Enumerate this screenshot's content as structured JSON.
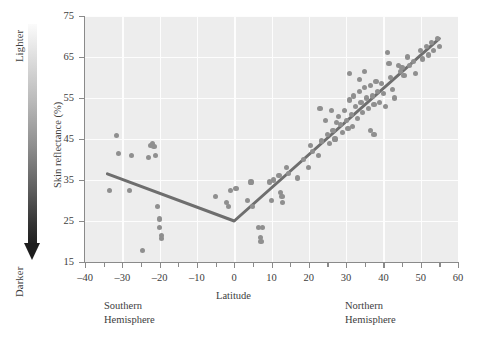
{
  "chart_data": {
    "type": "scatter",
    "title": "",
    "xlabel": "Latitude",
    "ylabel": "Skin reflectance (%)",
    "xlim": [
      -40,
      60
    ],
    "ylim": [
      15,
      75
    ],
    "xticks": [
      -40,
      -30,
      -20,
      -10,
      0,
      10,
      20,
      30,
      40,
      50,
      60
    ],
    "xtick_labels": [
      "–40",
      "–30",
      "–20",
      "–10",
      "0",
      "10",
      "20",
      "30",
      "40",
      "50",
      "60"
    ],
    "xtick_minor_step": 5,
    "yticks": [
      15,
      25,
      35,
      45,
      55,
      65,
      75
    ],
    "ytick_labels": [
      "15",
      "25",
      "35",
      "45",
      "55",
      "65",
      "75"
    ],
    "grid": true,
    "grid_color": "#fdfdfd",
    "plot_background": "#ededed",
    "legend": "none",
    "point_color": "#8f8f8f",
    "trendline_color": "#6e6e6e",
    "trendline": {
      "type": "piecewise-linear",
      "vertex": [
        0,
        25
      ],
      "points": [
        [
          -34,
          36.5
        ],
        [
          0,
          25
        ],
        [
          55,
          69.5
        ]
      ]
    },
    "annotations": [
      {
        "text": "Lighter",
        "position": "left-axis-top"
      },
      {
        "text": "Darker",
        "position": "left-axis-bottom"
      },
      {
        "text": "Southern\nHemisphere",
        "position": "below-axis-left"
      },
      {
        "text": "Northern\nHemisphere",
        "position": "below-axis-right"
      }
    ],
    "points": [
      [
        -33.5,
        32.5
      ],
      [
        -31.5,
        45.8
      ],
      [
        -31.0,
        41.5
      ],
      [
        -28.0,
        32.5
      ],
      [
        -27.5,
        41.0
      ],
      [
        -24.5,
        17.8
      ],
      [
        -23.0,
        40.5
      ],
      [
        -22.5,
        43.5
      ],
      [
        -22.0,
        44.0
      ],
      [
        -21.5,
        43.2
      ],
      [
        -21.0,
        41.0
      ],
      [
        -20.5,
        28.5
      ],
      [
        -20.0,
        25.5
      ],
      [
        -20.0,
        23.5
      ],
      [
        -19.5,
        21.5
      ],
      [
        -19.5,
        20.8
      ],
      [
        -5.0,
        31.0
      ],
      [
        -2.0,
        29.5
      ],
      [
        -1.5,
        28.5
      ],
      [
        -1.0,
        32.5
      ],
      [
        0.5,
        33.0
      ],
      [
        3.5,
        30.0
      ],
      [
        4.5,
        34.5
      ],
      [
        5.0,
        28.5
      ],
      [
        6.5,
        23.5
      ],
      [
        7.5,
        23.5
      ],
      [
        7.0,
        21.0
      ],
      [
        7.2,
        20.0
      ],
      [
        9.5,
        34.5
      ],
      [
        10.0,
        30.0
      ],
      [
        10.5,
        35.0
      ],
      [
        12.0,
        36.0
      ],
      [
        12.5,
        32.0
      ],
      [
        12.8,
        31.0
      ],
      [
        13.0,
        29.5
      ],
      [
        14.0,
        38.0
      ],
      [
        14.5,
        36.5
      ],
      [
        17.0,
        35.5
      ],
      [
        20.5,
        43.5
      ],
      [
        21.0,
        42.0
      ],
      [
        22.5,
        41.0
      ],
      [
        23.5,
        44.5
      ],
      [
        25.0,
        46.0
      ],
      [
        25.5,
        44.0
      ],
      [
        26.5,
        47.0
      ],
      [
        27.0,
        45.0
      ],
      [
        27.5,
        49.0
      ],
      [
        28.0,
        50.5
      ],
      [
        28.5,
        48.5
      ],
      [
        29.0,
        46.5
      ],
      [
        29.5,
        52.0
      ],
      [
        30.0,
        49.5
      ],
      [
        30.5,
        47.5
      ],
      [
        31.0,
        54.5
      ],
      [
        31.5,
        51.0
      ],
      [
        31.8,
        48.0
      ],
      [
        32.0,
        55.5
      ],
      [
        32.5,
        53.0
      ],
      [
        33.0,
        50.0
      ],
      [
        33.5,
        56.5
      ],
      [
        34.0,
        54.0
      ],
      [
        34.5,
        51.5
      ],
      [
        35.0,
        57.5
      ],
      [
        35.5,
        55.0
      ],
      [
        36.0,
        52.5
      ],
      [
        36.5,
        58.0
      ],
      [
        37.0,
        55.5
      ],
      [
        37.5,
        53.5
      ],
      [
        38.0,
        59.0
      ],
      [
        38.5,
        56.5
      ],
      [
        39.0,
        54.0
      ],
      [
        39.5,
        58.5
      ],
      [
        40.0,
        56.0
      ],
      [
        40.5,
        53.0
      ],
      [
        41.0,
        66.0
      ],
      [
        41.5,
        63.5
      ],
      [
        42.0,
        60.0
      ],
      [
        42.5,
        57.0
      ],
      [
        43.0,
        55.0
      ],
      [
        44.0,
        63.0
      ],
      [
        44.5,
        61.5
      ],
      [
        45.0,
        62.5
      ],
      [
        45.5,
        60.5
      ],
      [
        46.5,
        65.0
      ],
      [
        47.0,
        63.0
      ],
      [
        48.0,
        64.0
      ],
      [
        48.5,
        61.0
      ],
      [
        50.0,
        66.5
      ],
      [
        50.5,
        64.5
      ],
      [
        51.5,
        67.5
      ],
      [
        52.0,
        65.5
      ],
      [
        53.0,
        68.5
      ],
      [
        53.5,
        66.5
      ],
      [
        54.5,
        69.5
      ],
      [
        55.0,
        67.5
      ],
      [
        31.0,
        61.0
      ],
      [
        33.5,
        59.5
      ],
      [
        35.0,
        61.5
      ],
      [
        26.0,
        52.0
      ],
      [
        24.5,
        49.5
      ],
      [
        23.0,
        52.5
      ],
      [
        36.5,
        47.0
      ],
      [
        37.5,
        46.0
      ],
      [
        20.0,
        38.0
      ],
      [
        18.5,
        40.0
      ]
    ]
  },
  "axes": {
    "x_title": "Latitude",
    "y_title": "Skin reflectance (%)"
  },
  "gradient_legend": {
    "top_label": "Lighter",
    "bottom_label": "Darker"
  },
  "notes": {
    "southern": "Southern\nHemisphere",
    "northern": "Northern\nHemisphere"
  }
}
